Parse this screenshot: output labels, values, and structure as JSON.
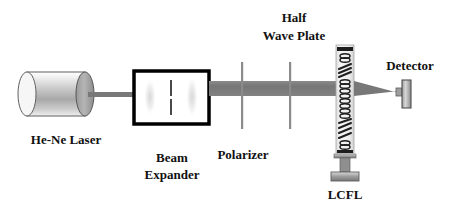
{
  "figure": {
    "kind": "optical-setup-diagram",
    "width": 450,
    "height": 210,
    "background": "#ffffff"
  },
  "labels": {
    "laser": "He-Ne Laser",
    "beam_expander_line1": "Beam",
    "beam_expander_line2": "Expander",
    "polarizer": "Polarizer",
    "half_wave_plate_line1": "Half",
    "half_wave_plate_line2": "Wave Plate",
    "lcfl": "LCFL",
    "detector": "Detector"
  },
  "colors": {
    "ink": "#111111",
    "beam": "#7a7a7a",
    "beam_dark": "#6e6e6e",
    "metal_light": "#f2f2f2",
    "metal_mid": "#9a9a9a",
    "metal_dark": "#5c5c5c",
    "outline": "#000000",
    "cell_fill": "#f4f4f4",
    "optic_line": "#8a8a8a"
  },
  "components": [
    {
      "name": "he-ne-laser",
      "type": "cylinder",
      "x": 18,
      "y": 72,
      "width": 72,
      "height": 44,
      "label": "He-Ne Laser"
    },
    {
      "name": "input-beam",
      "type": "beam-thin",
      "x1": 90,
      "y1": 95,
      "x2": 134,
      "y2": 95,
      "thickness": 4
    },
    {
      "name": "beam-expander",
      "type": "box",
      "x": 134,
      "y": 71,
      "width": 75,
      "height": 53,
      "label": "Beam Expander"
    },
    {
      "name": "expanded-beam",
      "type": "beam-wide",
      "x1": 209,
      "y1": 88,
      "x2": 336,
      "y2": 88,
      "thickness": 14
    },
    {
      "name": "polarizer",
      "type": "vertical-optic",
      "x": 242,
      "y_top": 62,
      "y_bottom": 129,
      "label": "Polarizer"
    },
    {
      "name": "half-wave-plate",
      "type": "vertical-optic",
      "x": 290,
      "y_top": 62,
      "y_bottom": 129,
      "label": "Half Wave Plate"
    },
    {
      "name": "lcfl-cell",
      "type": "liquid-crystal-cell",
      "x": 336,
      "y": 45,
      "width": 18,
      "height": 108,
      "label": "LCFL",
      "texture": "alternating ellipse-pairs and slanted zigzag domains"
    },
    {
      "name": "converging-beam",
      "type": "beam-taper",
      "x1": 354,
      "y1": 88,
      "x2": 400,
      "y2": 96
    },
    {
      "name": "detector",
      "type": "plate",
      "x": 398,
      "y": 82,
      "width": 12,
      "height": 28,
      "label": "Detector"
    }
  ],
  "label_positions": {
    "laser": {
      "x": 66,
      "y": 144
    },
    "beam_expander_line1": {
      "x": 172,
      "y": 162
    },
    "beam_expander_line2": {
      "x": 172,
      "y": 179
    },
    "polarizer": {
      "x": 243,
      "y": 159
    },
    "half_wave_plate_line1": {
      "x": 294,
      "y": 22
    },
    "half_wave_plate_line2": {
      "x": 294,
      "y": 40
    },
    "lcfl": {
      "x": 345,
      "y": 199
    },
    "detector": {
      "x": 410,
      "y": 70
    }
  }
}
